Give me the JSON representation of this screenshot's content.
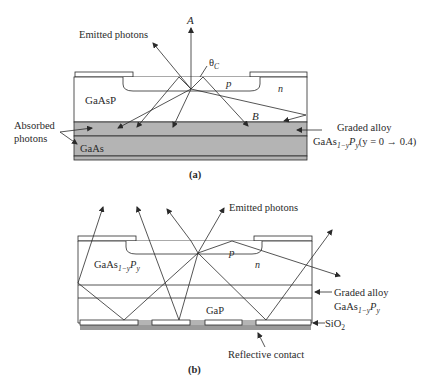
{
  "figure_a": {
    "caption": "(a)",
    "label_A": "A",
    "label_emitted": "Emitted photons",
    "label_theta": "θ",
    "label_theta_sub": "C",
    "label_p": "p",
    "label_n": "n",
    "label_gaasp": "GaAsP",
    "label_B": "B",
    "label_absorbed_1": "Absorbed",
    "label_absorbed_2": "photons",
    "label_gaas": "GaAs",
    "label_graded": "Graded alloy",
    "label_formula_base": "GaAs",
    "label_formula_sub1": "1−y",
    "label_formula_P": "P",
    "label_formula_sub2": "y",
    "label_formula_range": "(y = 0 → 0.4)"
  },
  "figure_b": {
    "caption": "(b)",
    "label_emitted": "Emitted photons",
    "label_p": "p",
    "label_n": "n",
    "label_formula_base": "GaAs",
    "label_formula_sub1": "1−y",
    "label_formula_P": "P",
    "label_formula_sub2": "y",
    "label_graded": "Graded alloy",
    "label_gap": "GaP",
    "label_sio2": "SiO",
    "label_sio2_sub": "2",
    "label_reflective": "Reflective contact"
  },
  "colors": {
    "substrate_gray": "#b4b4b4",
    "line": "#2a2a2a",
    "contact_gray": "#9a9a9a"
  }
}
